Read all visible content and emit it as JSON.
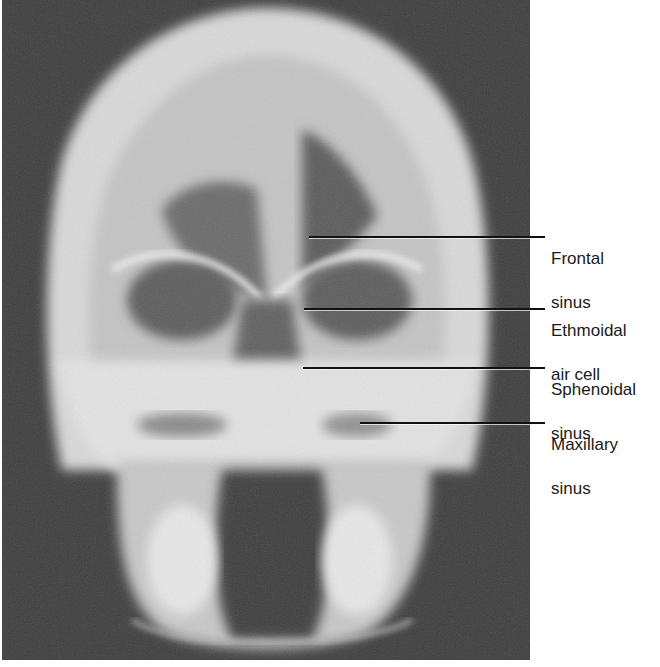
{
  "figure": {
    "colors": {
      "background": "#3d3d3d",
      "bone": "#e6e6e6",
      "air": "#555555",
      "leader_line": "#111111",
      "label_text": "#1a1a1a"
    }
  },
  "labels": [
    {
      "id": "frontal",
      "line1": "Frontal",
      "line2": "sinus",
      "line_start_x": 309,
      "line_y": 237
    },
    {
      "id": "ethmoidal",
      "line1": "Ethmoidal",
      "line2": "air cell",
      "line_start_x": 304,
      "line_y": 309
    },
    {
      "id": "sphenoidal",
      "line1": "Sphenoidal",
      "line2": "sinus",
      "line_start_x": 303,
      "line_y": 368
    },
    {
      "id": "maxillary",
      "line1": "Maxillary",
      "line2": "sinus",
      "line_start_x": 360,
      "line_y": 423
    }
  ]
}
